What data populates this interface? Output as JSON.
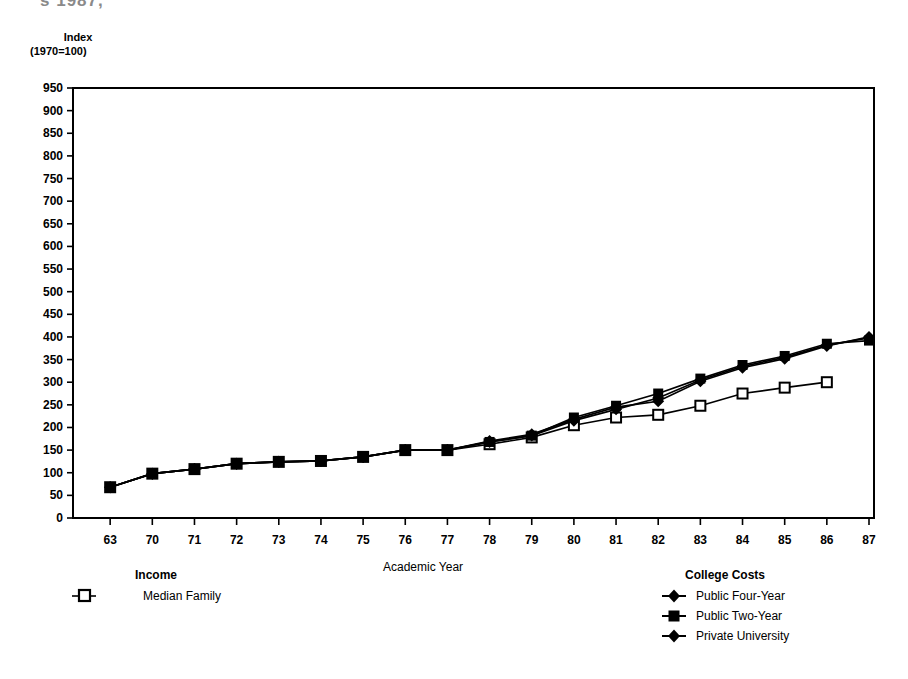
{
  "page": {
    "cut_title_fragment": "s 1987,"
  },
  "axis": {
    "y_unit_line1": "Index",
    "y_unit_line2": "(1970=100)",
    "x_title": "Academic Year"
  },
  "legends": {
    "income": {
      "title": "Income",
      "items": [
        {
          "label": "Median Family",
          "marker": "open-square-marker"
        }
      ]
    },
    "college_costs": {
      "title": "College Costs",
      "items": [
        {
          "label": "Public Four-Year",
          "marker": "filled-diamond-marker"
        },
        {
          "label": "Public Two-Year",
          "marker": "filled-square-marker"
        },
        {
          "label": "Private University",
          "marker": "filled-diamond-marker"
        }
      ]
    }
  },
  "chart_data": {
    "type": "line",
    "title": "",
    "xlabel": "Academic Year",
    "ylabel": "Index (1970=100)",
    "ylim": [
      0,
      950
    ],
    "ytick_step": 50,
    "yticks": [
      0,
      50,
      100,
      150,
      200,
      250,
      300,
      350,
      400,
      450,
      500,
      550,
      600,
      650,
      700,
      750,
      800,
      850,
      900,
      950
    ],
    "categories": [
      "63",
      "70",
      "71",
      "72",
      "73",
      "74",
      "75",
      "76",
      "77",
      "78",
      "79",
      "80",
      "81",
      "82",
      "83",
      "84",
      "85",
      "86",
      "87"
    ],
    "grid": false,
    "legend_position": "below-plot",
    "series": [
      {
        "name": "Median Family",
        "group": "Income",
        "marker": "open-square",
        "values": [
          68,
          98,
          108,
          120,
          124,
          126,
          135,
          150,
          150,
          163,
          178,
          205,
          222,
          228,
          248,
          275,
          288,
          300,
          null
        ]
      },
      {
        "name": "Public Four-Year",
        "group": "College Costs",
        "marker": "filled-diamond",
        "values": [
          68,
          98,
          108,
          120,
          124,
          126,
          135,
          150,
          150,
          168,
          182,
          215,
          240,
          265,
          305,
          335,
          355,
          382,
          398
        ]
      },
      {
        "name": "Public Two-Year",
        "group": "College Costs",
        "marker": "filled-square",
        "values": [
          68,
          98,
          108,
          120,
          124,
          126,
          135,
          150,
          150,
          168,
          182,
          222,
          248,
          275,
          308,
          338,
          358,
          385,
          392
        ]
      },
      {
        "name": "Private University",
        "group": "College Costs",
        "marker": "filled-diamond",
        "values": [
          68,
          98,
          108,
          120,
          124,
          126,
          135,
          150,
          150,
          170,
          185,
          218,
          245,
          258,
          302,
          332,
          352,
          380,
          400
        ]
      }
    ]
  }
}
